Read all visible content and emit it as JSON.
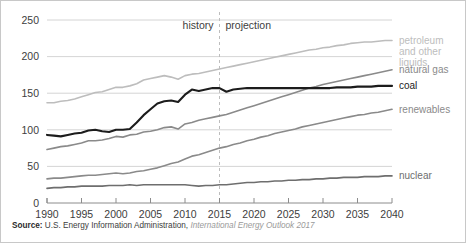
{
  "source": {
    "bold_label": "Source:",
    "agency": "U.S. Energy Information Administration,",
    "publication": "International Energy Outlook 2017"
  },
  "annotations": {
    "history": "history",
    "projection": "projection",
    "divider_year": 2015
  },
  "legend": [
    {
      "key": "petroleum",
      "label": "petroleum\nand other\nliquids",
      "line1": "petroleum",
      "line2": "and other",
      "line3": "liquids",
      "color": "#bdbdbd"
    },
    {
      "key": "natural_gas",
      "label": "natural gas",
      "color": "#8a8a8a"
    },
    {
      "key": "coal",
      "label": "coal",
      "color": "#1c1c1c"
    },
    {
      "key": "renewables",
      "label": "renewables",
      "color": "#8a8a8a"
    },
    {
      "key": "nuclear",
      "label": "nuclear",
      "color": "#6e6e6e"
    }
  ],
  "chart_data": {
    "type": "line",
    "title": "",
    "subtitle": "",
    "xlabel": "",
    "ylabel": "",
    "xlim": [
      1990,
      2040
    ],
    "ylim": [
      0,
      250
    ],
    "xticks": [
      1990,
      1995,
      2000,
      2005,
      2010,
      2015,
      2020,
      2025,
      2030,
      2035,
      2040
    ],
    "yticks": [
      0,
      50,
      100,
      150,
      200,
      250
    ],
    "grid": true,
    "legend_position": "right",
    "history_end": 2015,
    "x": [
      1990,
      1991,
      1992,
      1993,
      1994,
      1995,
      1996,
      1997,
      1998,
      1999,
      2000,
      2001,
      2002,
      2003,
      2004,
      2005,
      2006,
      2007,
      2008,
      2009,
      2010,
      2011,
      2012,
      2013,
      2014,
      2015,
      2016,
      2017,
      2018,
      2019,
      2020,
      2021,
      2022,
      2023,
      2024,
      2025,
      2026,
      2027,
      2028,
      2029,
      2030,
      2031,
      2032,
      2033,
      2034,
      2035,
      2036,
      2037,
      2038,
      2039,
      2040
    ],
    "series": [
      {
        "name": "petroleum and other liquids",
        "color": "#bdbdbd",
        "width": 1.6,
        "values": [
          137,
          137,
          139,
          140,
          142,
          145,
          148,
          151,
          152,
          155,
          158,
          158,
          160,
          163,
          168,
          170,
          172,
          174,
          172,
          169,
          174,
          176,
          177,
          179,
          181,
          183,
          185,
          187,
          189,
          191,
          193,
          195,
          197,
          199,
          201,
          203,
          205,
          207,
          209,
          210,
          212,
          213,
          215,
          216,
          218,
          219,
          220,
          220,
          221,
          222,
          222
        ]
      },
      {
        "name": "natural gas",
        "color": "#8a8a8a",
        "width": 1.6,
        "values": [
          73,
          75,
          77,
          78,
          80,
          82,
          85,
          85,
          86,
          88,
          91,
          90,
          93,
          94,
          97,
          98,
          100,
          103,
          104,
          101,
          108,
          110,
          113,
          115,
          117,
          119,
          121,
          124,
          127,
          130,
          133,
          136,
          139,
          142,
          145,
          148,
          151,
          154,
          157,
          159,
          162,
          164,
          166,
          168,
          170,
          172,
          174,
          176,
          178,
          180,
          182
        ]
      },
      {
        "name": "coal",
        "color": "#1c1c1c",
        "width": 2.1,
        "values": [
          93,
          92,
          91,
          93,
          95,
          96,
          99,
          100,
          98,
          97,
          100,
          100,
          101,
          110,
          120,
          128,
          136,
          139,
          140,
          138,
          148,
          155,
          153,
          155,
          157,
          157,
          152,
          155,
          156,
          157,
          157,
          157,
          157,
          157,
          157,
          157,
          157,
          157,
          157,
          157,
          157,
          157,
          158,
          158,
          158,
          159,
          159,
          159,
          160,
          160,
          160
        ]
      },
      {
        "name": "renewables",
        "color": "#8a8a8a",
        "width": 1.6,
        "values": [
          33,
          34,
          34,
          35,
          36,
          37,
          38,
          38,
          39,
          40,
          41,
          40,
          41,
          43,
          44,
          46,
          48,
          51,
          54,
          56,
          60,
          64,
          66,
          69,
          72,
          75,
          77,
          80,
          82,
          85,
          87,
          90,
          92,
          95,
          97,
          99,
          101,
          104,
          106,
          108,
          110,
          112,
          114,
          116,
          118,
          120,
          121,
          123,
          124,
          126,
          128
        ]
      },
      {
        "name": "nuclear",
        "color": "#6e6e6e",
        "width": 1.6,
        "values": [
          20,
          21,
          21,
          22,
          22,
          23,
          23,
          23,
          23,
          24,
          24,
          24,
          25,
          24,
          25,
          25,
          25,
          25,
          25,
          25,
          25,
          24,
          23,
          24,
          24,
          25,
          25,
          26,
          27,
          28,
          28,
          29,
          29,
          30,
          30,
          31,
          31,
          32,
          32,
          33,
          33,
          34,
          34,
          35,
          35,
          35,
          36,
          36,
          36,
          37,
          37
        ]
      }
    ]
  }
}
